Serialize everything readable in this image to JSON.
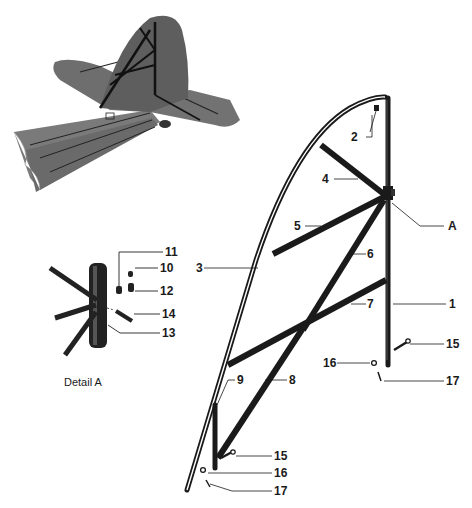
{
  "figure": {
    "overview_view": "tail assembly overview (fin and stabilizer with internal frame)",
    "detail_caption": "Detail A",
    "callout_labels": {
      "p1": "1",
      "p2": "2",
      "p3": "3",
      "p4": "4",
      "p5": "5",
      "p6": "6",
      "p7": "7",
      "p8": "8",
      "p9": "9",
      "p10": "10",
      "p11": "11",
      "p12": "12",
      "p13": "13",
      "p14": "14",
      "p15a": "15",
      "p15b": "15",
      "p16a": "16",
      "p16b": "16",
      "p17a": "17",
      "p17b": "17",
      "detailA": "A"
    },
    "colors": {
      "ink": "#1a1a1a",
      "skin": "#6f6f6f",
      "background": "#ffffff"
    }
  }
}
